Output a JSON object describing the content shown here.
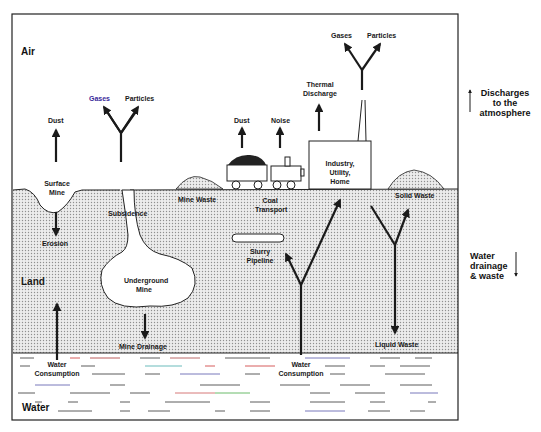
{
  "zones": {
    "air": "Air",
    "land": "Land",
    "water": "Water"
  },
  "air_labels": {
    "dust_surface": "Dust",
    "gases_left": "Gases",
    "particles_left": "Particles",
    "dust_transport": "Dust",
    "noise": "Noise",
    "thermal_discharge_1": "Thermal",
    "thermal_discharge_2": "Discharge",
    "gases_right": "Gases",
    "particles_right": "Particles"
  },
  "surface_labels": {
    "surface_mine_1": "Surface",
    "surface_mine_2": "Mine",
    "mine_waste": "Mine Waste",
    "coal_transport_1": "Coal",
    "coal_transport_2": "Transport",
    "industry_1": "Industry,",
    "industry_2": "Utility,",
    "industry_3": "Home",
    "solid_waste": "Solid Waste"
  },
  "land_labels": {
    "erosion": "Erosion",
    "subsidence": "Subsidence",
    "underground_mine_1": "Underground",
    "underground_mine_2": "Mine",
    "slurry_pipeline_1": "Slurry",
    "slurry_pipeline_2": "Pipeline",
    "mine_drainage": "Mine Drainage",
    "liquid_waste": "Liquid Waste"
  },
  "water_labels": {
    "water_consumption_left_1": "Water",
    "water_consumption_left_2": "Consumption",
    "water_consumption_right_1": "Water",
    "water_consumption_right_2": "Consumption"
  },
  "legend": {
    "discharges_1": "Discharges",
    "discharges_2": "to the",
    "discharges_3": "atmosphere",
    "drainage_1": "Water",
    "drainage_2": "drainage",
    "drainage_3": "& waste"
  },
  "colors": {
    "line": "#1a1a1a",
    "land_dot": "#9a9a9a",
    "land_bg": "#e9e9e9",
    "frame": "#222222"
  }
}
